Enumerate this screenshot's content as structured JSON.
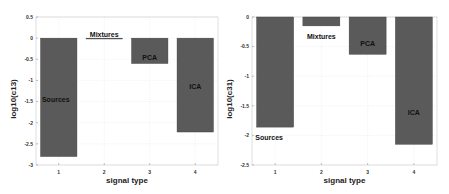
{
  "chart_data": [
    {
      "type": "bar",
      "title": "",
      "xlabel": "signal type",
      "ylabel": "log10(c13)",
      "categories": [
        "1",
        "2",
        "3",
        "4"
      ],
      "values": [
        -2.8,
        -0.02,
        -0.6,
        -2.22
      ],
      "bar_labels": [
        "Sources",
        "Mixtures",
        "PCA",
        "ICA"
      ],
      "ylim": [
        -3,
        0.5
      ],
      "yticks": [
        0.5,
        0,
        -0.5,
        -1,
        -1.5,
        -2,
        -2.5,
        -3
      ],
      "ytick_labels": [
        "0.5",
        "0",
        "-0.5",
        "-1",
        "-1.5",
        "-2",
        "-2.5",
        "-3"
      ],
      "grid": true,
      "bar_color": "#5a5a5a"
    },
    {
      "type": "bar",
      "title": "",
      "xlabel": "signal type",
      "ylabel": "log10(c31)",
      "categories": [
        "1",
        "2",
        "3",
        "4"
      ],
      "values": [
        -1.86,
        -0.15,
        -0.63,
        -2.15
      ],
      "bar_labels": [
        "Sources",
        "Mixtures",
        "PCA",
        "ICA"
      ],
      "ylim": [
        -2.5,
        0
      ],
      "yticks": [
        0,
        -0.5,
        -1,
        -1.5,
        -2,
        -2.5
      ],
      "ytick_labels": [
        "0",
        "-0.5",
        "-1",
        "-1.5",
        "-2",
        "-2.5"
      ],
      "grid": true,
      "bar_color": "#5a5a5a"
    }
  ]
}
